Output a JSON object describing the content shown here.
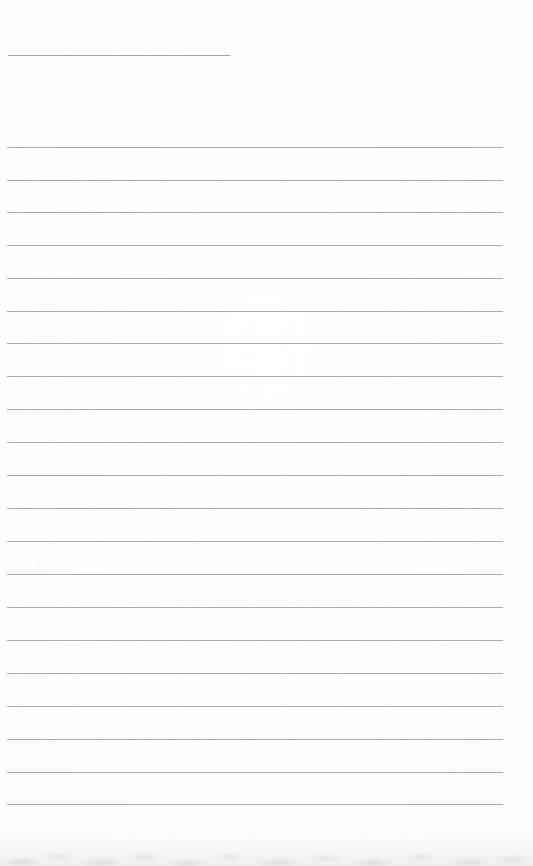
{
  "document": {
    "kind": "blank-ruled-paper-scan",
    "title": "",
    "visible_text": "",
    "background_color": "#fdfdfd",
    "rule_color": "#a9abb1",
    "width": 533,
    "height": 866
  },
  "header_rule": {
    "name": "header-rule",
    "x": 8,
    "y": 55,
    "width": 222,
    "thickness": 1
  },
  "ruled_lines": {
    "count": 21,
    "first_y": 147,
    "spacing": 32.85,
    "x": 7,
    "width": 496,
    "thickness": 1,
    "items": [
      {
        "index": 1,
        "y": 147
      },
      {
        "index": 2,
        "y": 180
      },
      {
        "index": 3,
        "y": 212
      },
      {
        "index": 4,
        "y": 245
      },
      {
        "index": 5,
        "y": 278
      },
      {
        "index": 6,
        "y": 311
      },
      {
        "index": 7,
        "y": 343
      },
      {
        "index": 8,
        "y": 376
      },
      {
        "index": 9,
        "y": 409
      },
      {
        "index": 10,
        "y": 442
      },
      {
        "index": 11,
        "y": 475
      },
      {
        "index": 12,
        "y": 508
      },
      {
        "index": 13,
        "y": 541
      },
      {
        "index": 14,
        "y": 574
      },
      {
        "index": 15,
        "y": 607
      },
      {
        "index": 16,
        "y": 640
      },
      {
        "index": 17,
        "y": 673
      },
      {
        "index": 18,
        "y": 706
      },
      {
        "index": 19,
        "y": 739
      },
      {
        "index": 20,
        "y": 772
      },
      {
        "index": 21,
        "y": 804
      }
    ]
  },
  "artifacts": {
    "bottom_mottle": {
      "name": "scan-noise-bottom",
      "y": 832,
      "height": 34
    },
    "top_mottle": {
      "name": "scan-noise-top",
      "y": 0,
      "height": 130
    }
  }
}
